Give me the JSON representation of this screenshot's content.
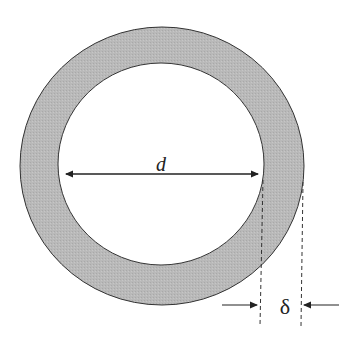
{
  "diagram": {
    "type": "annulus cross-section",
    "labels": {
      "inner_diameter": "d",
      "wall_thickness": "δ"
    },
    "colors": {
      "ring_fill": "#b8b8b8",
      "outline": "#333333",
      "background": "#ffffff"
    }
  }
}
